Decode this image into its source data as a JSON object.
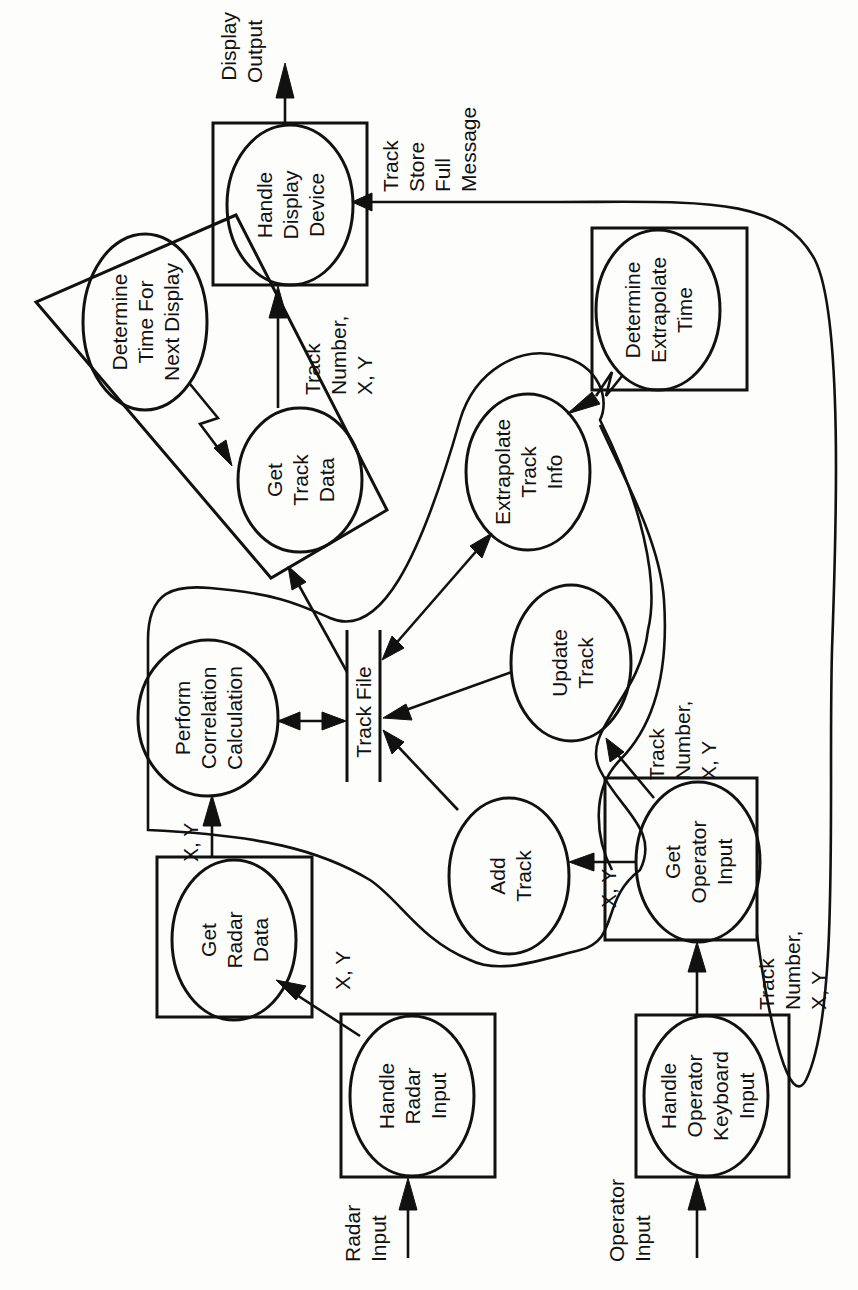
{
  "diagram": {
    "type": "data-flow / process-structure diagram (rotated 90° counter-clockwise)",
    "colors": {
      "ink": "#111111",
      "paper": "#fdfdfb"
    },
    "processes": {
      "handle_display_device": [
        "Handle",
        "Display",
        "Device"
      ],
      "determine_time_next_display": [
        "Determine",
        "Time For",
        "Next Display"
      ],
      "get_track_data": [
        "Get",
        "Track",
        "Data"
      ],
      "determine_extrapolate_time": [
        "Determine",
        "Extrapolate",
        "Time"
      ],
      "extrapolate_track_info": [
        "Extrapolate",
        "Track",
        "Info"
      ],
      "perform_correlation_calculation": [
        "Perform",
        "Correlation",
        "Calculation"
      ],
      "update_track": [
        "Update",
        "Track"
      ],
      "add_track": [
        "Add",
        "Track"
      ],
      "get_operator_input": [
        "Get",
        "Operator",
        "Input"
      ],
      "get_radar_data": [
        "Get",
        "Radar",
        "Data"
      ],
      "handle_radar_input": [
        "Handle",
        "Radar",
        "Input"
      ],
      "handle_operator_keyboard_input": [
        "Handle",
        "Operator",
        "Keyboard",
        "Input"
      ]
    },
    "data_store": {
      "track_file": "Track File"
    },
    "flow_labels": {
      "display_output": [
        "Display",
        "Output"
      ],
      "track_store_full_message": [
        "Track",
        "Store",
        "Full",
        "Message"
      ],
      "track_number_xy_display": [
        "Track",
        "Number,",
        "X, Y"
      ],
      "xy_to_correlation": "X, Y",
      "xy_radar": "X, Y",
      "xy_add_track": "X, Y",
      "track_number_xy_update": [
        "Track",
        "Number,",
        "X, Y"
      ],
      "track_number_xy_keyboard": [
        "Track",
        "Number,",
        "X, Y"
      ],
      "radar_input": [
        "Radar",
        "Input"
      ],
      "operator_input": [
        "Operator",
        "Input"
      ]
    }
  }
}
